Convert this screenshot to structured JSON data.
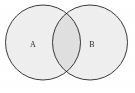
{
  "figure": {
    "kind": "venn-diagram",
    "width": 135,
    "height": 93,
    "background_color": "#ffffff"
  },
  "style": {
    "fill_color": "#efefef",
    "stroke_color": "#3a3a3a",
    "stroke_width": 1,
    "label_color": "#2b2b2b",
    "label_font_size": 8
  },
  "sets": [
    {
      "id": "set-a",
      "label": "A",
      "cx": 43,
      "cy": 42.5,
      "r": 37.5,
      "label_x": 33,
      "label_y": 45.5
    },
    {
      "id": "set-b",
      "label": "B",
      "cx": 90,
      "cy": 42.5,
      "r": 37.5,
      "label_x": 92,
      "label_y": 45.5
    }
  ],
  "intersection": {
    "present": true,
    "top_crossing_x": 66.5,
    "top_crossing_y": 10,
    "bottom_crossing_x": 66.5,
    "bottom_crossing_y": 75
  }
}
